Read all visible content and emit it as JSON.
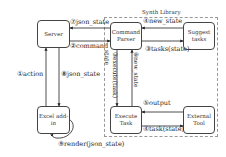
{
  "group": {
    "title": "Synth Library"
  },
  "nodes": {
    "server": "Server",
    "command_parser": "Command Parser",
    "suggest_tasks": "Suggest tasks",
    "excel_addin": "Excel add-in",
    "execute_task": "Execute Task",
    "external_tool": "External Tool"
  },
  "edges": {
    "e1": "①action",
    "e2": "②command",
    "e2b": "state",
    "e3": "③execute(task)",
    "e3b": "③tasks(state)",
    "e4": "④new_state",
    "e4b": "④task(state)",
    "e5": "⑤output",
    "e6": "⑥new_state",
    "e7": "⑦json_state",
    "e8": "⑧json_state",
    "e9": "⑨render(json_state)"
  }
}
